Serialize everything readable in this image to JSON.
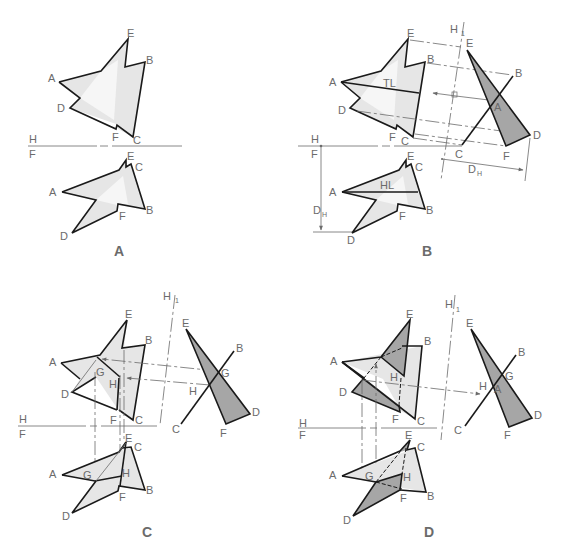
{
  "figure": {
    "colors": {
      "line": "#1a1a1a",
      "label": "#6b6b6b",
      "light_fill": "#e6e6e6",
      "dark_fill": "#a6a6a6"
    },
    "panels": [
      {
        "id": "A",
        "caption": "A",
        "fold_line": {
          "top": "H",
          "bottom": "F"
        },
        "horizontal_view_labels": [
          "E",
          "B",
          "A",
          "D",
          "F",
          "C"
        ],
        "front_view_labels": [
          "E",
          "C",
          "A",
          "B",
          "F",
          "D"
        ]
      },
      {
        "id": "B",
        "caption": "B",
        "fold_line": {
          "top": "H",
          "bottom": "F"
        },
        "aux_fold_line": {
          "left": "H",
          "right": "1"
        },
        "horizontal_view_labels": [
          "E",
          "B",
          "A",
          "D",
          "F",
          "C"
        ],
        "front_view_labels": [
          "E",
          "C",
          "A",
          "B",
          "F",
          "D"
        ],
        "aux_view_labels": [
          "E",
          "B",
          "A",
          "D",
          "F",
          "C"
        ],
        "annotations": {
          "true_length": "TL",
          "horizontal_line": "HL",
          "dimension": "D",
          "dimension_sub": "H"
        }
      },
      {
        "id": "C",
        "caption": "C",
        "fold_line": {
          "top": "H",
          "bottom": "F"
        },
        "aux_fold_line": {
          "left": "H",
          "right": "1"
        },
        "horizontal_view_labels": [
          "E",
          "B",
          "A",
          "G",
          "H",
          "D",
          "F",
          "C"
        ],
        "front_view_labels": [
          "E",
          "C",
          "A",
          "G",
          "H",
          "B",
          "F",
          "D"
        ],
        "aux_view_labels": [
          "E",
          "B",
          "G",
          "H",
          "D",
          "C",
          "F"
        ]
      },
      {
        "id": "D",
        "caption": "D",
        "fold_line": {
          "top": "H",
          "bottom": "F"
        },
        "aux_fold_line": {
          "left": "H",
          "right": "1"
        },
        "horizontal_view_labels": [
          "E",
          "B",
          "A",
          "H",
          "D",
          "F",
          "C"
        ],
        "front_view_labels": [
          "E",
          "C",
          "A",
          "G",
          "H",
          "B",
          "F",
          "D"
        ],
        "aux_view_labels": [
          "E",
          "B",
          "G",
          "H",
          "A",
          "D",
          "C",
          "F"
        ]
      }
    ]
  }
}
